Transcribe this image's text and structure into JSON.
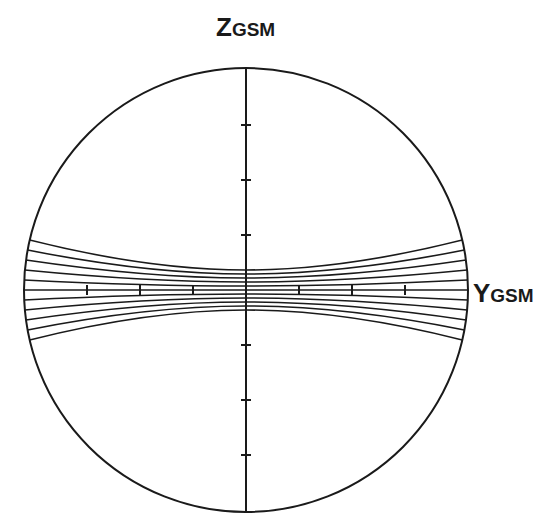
{
  "diagram": {
    "type": "magnetic field line cross-section",
    "axes": {
      "vertical": {
        "label_main": "Z",
        "label_sub": "GSM",
        "ticks_above_center": 3,
        "ticks_below_center": 3
      },
      "horizontal": {
        "label_main": "Y",
        "label_sub": "GSM",
        "ticks_left_of_center": 3,
        "ticks_right_of_center": 3
      }
    },
    "boundary": {
      "shape": "circle",
      "center": [
        246,
        290
      ],
      "radius": 222
    },
    "field_lines": {
      "count_above_axis": 5,
      "count_below_axis": 5,
      "center_spacing_px": 4,
      "edge_spacing_px": 10,
      "shape": "hourglass / pinched toward center"
    },
    "colors": {
      "line": "#1a1a1a",
      "background": "#ffffff"
    }
  }
}
